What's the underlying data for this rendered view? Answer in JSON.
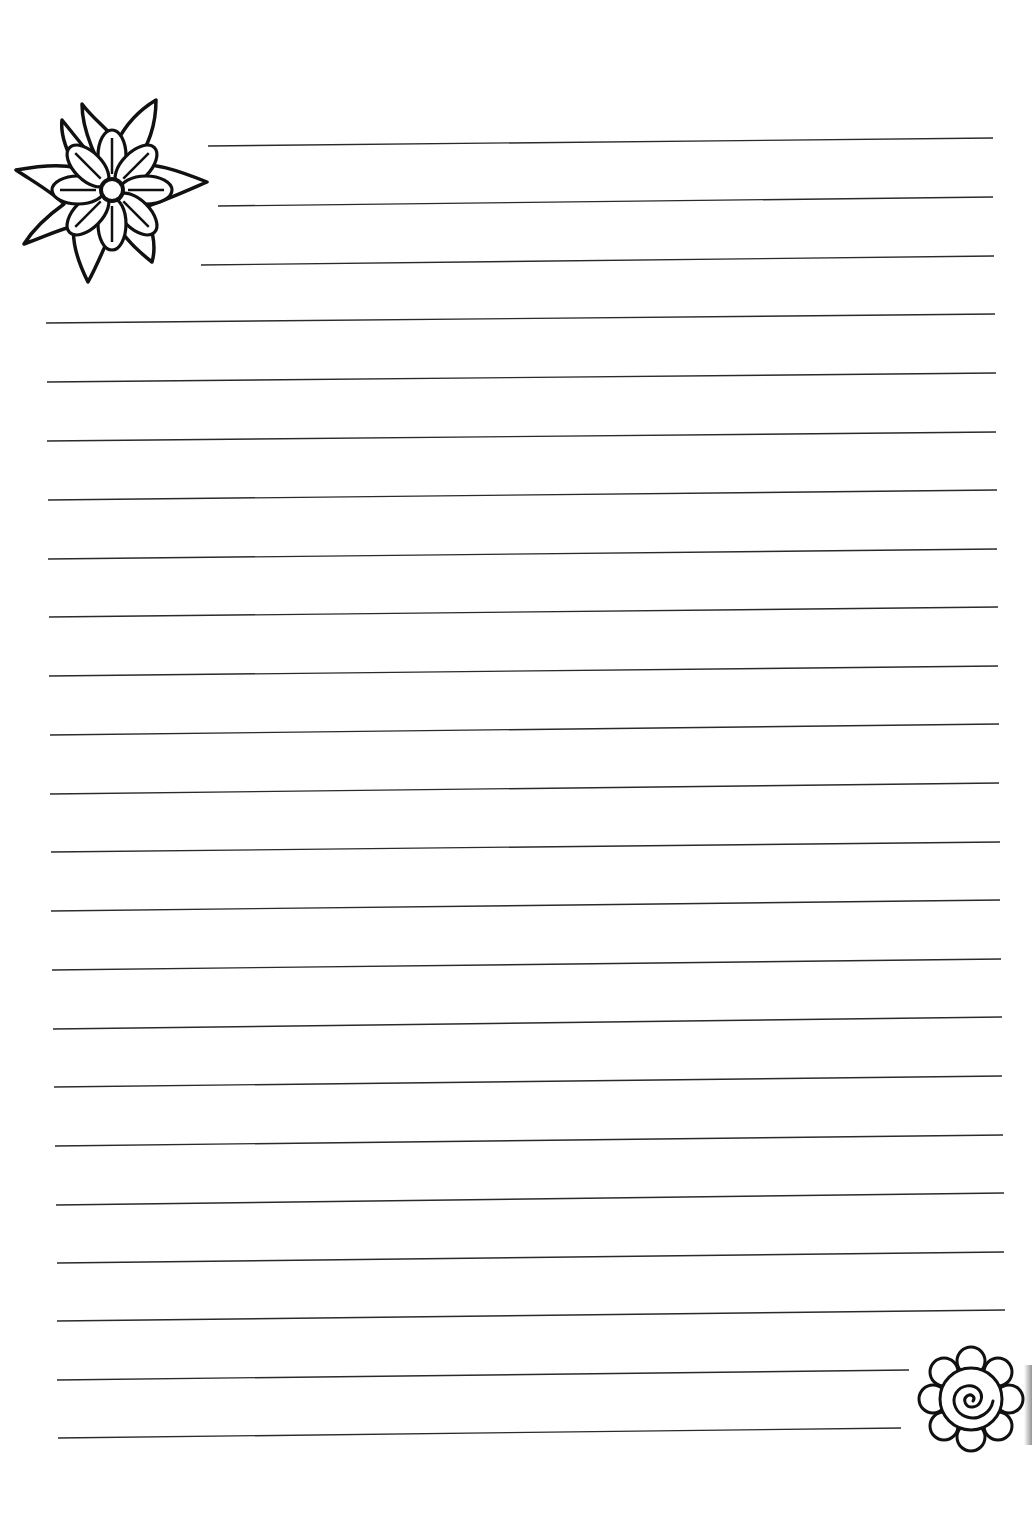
{
  "page": {
    "background": "#ffffff",
    "line_color": "#2a2a2a",
    "ink_color": "#111111"
  },
  "lines": [
    {
      "x1": 208,
      "y1": 146,
      "x2": 993,
      "y2": 138
    },
    {
      "x1": 218,
      "y1": 206,
      "x2": 993,
      "y2": 197
    },
    {
      "x1": 201,
      "y1": 265,
      "x2": 994,
      "y2": 256
    },
    {
      "x1": 46,
      "y1": 323,
      "x2": 995,
      "y2": 314
    },
    {
      "x1": 47,
      "y1": 382,
      "x2": 996,
      "y2": 373
    },
    {
      "x1": 47,
      "y1": 441,
      "x2": 996,
      "y2": 432
    },
    {
      "x1": 48,
      "y1": 500,
      "x2": 997,
      "y2": 490
    },
    {
      "x1": 48,
      "y1": 559,
      "x2": 997,
      "y2": 549
    },
    {
      "x1": 49,
      "y1": 617,
      "x2": 998,
      "y2": 607
    },
    {
      "x1": 49,
      "y1": 676,
      "x2": 998,
      "y2": 666
    },
    {
      "x1": 50,
      "y1": 735,
      "x2": 999,
      "y2": 724
    },
    {
      "x1": 50,
      "y1": 794,
      "x2": 999,
      "y2": 783
    },
    {
      "x1": 51,
      "y1": 852,
      "x2": 1000,
      "y2": 842
    },
    {
      "x1": 51,
      "y1": 911,
      "x2": 1000,
      "y2": 900
    },
    {
      "x1": 52,
      "y1": 970,
      "x2": 1001,
      "y2": 959
    },
    {
      "x1": 53,
      "y1": 1029,
      "x2": 1002,
      "y2": 1017
    },
    {
      "x1": 54,
      "y1": 1087,
      "x2": 1002,
      "y2": 1076
    },
    {
      "x1": 55,
      "y1": 1146,
      "x2": 1003,
      "y2": 1135
    },
    {
      "x1": 56,
      "y1": 1205,
      "x2": 1004,
      "y2": 1193
    },
    {
      "x1": 57,
      "y1": 1263,
      "x2": 1004,
      "y2": 1252
    },
    {
      "x1": 57,
      "y1": 1321,
      "x2": 1005,
      "y2": 1310
    },
    {
      "x1": 57,
      "y1": 1380,
      "x2": 909,
      "y2": 1370
    },
    {
      "x1": 58,
      "y1": 1438,
      "x2": 901,
      "y2": 1428
    }
  ],
  "decorations": {
    "top_left": {
      "icon": "star-flower-icon",
      "x": 12,
      "y": 90,
      "size": 200
    },
    "bottom_right": {
      "icon": "spiral-flower-icon",
      "x": 912,
      "y": 1340,
      "size": 118
    }
  }
}
